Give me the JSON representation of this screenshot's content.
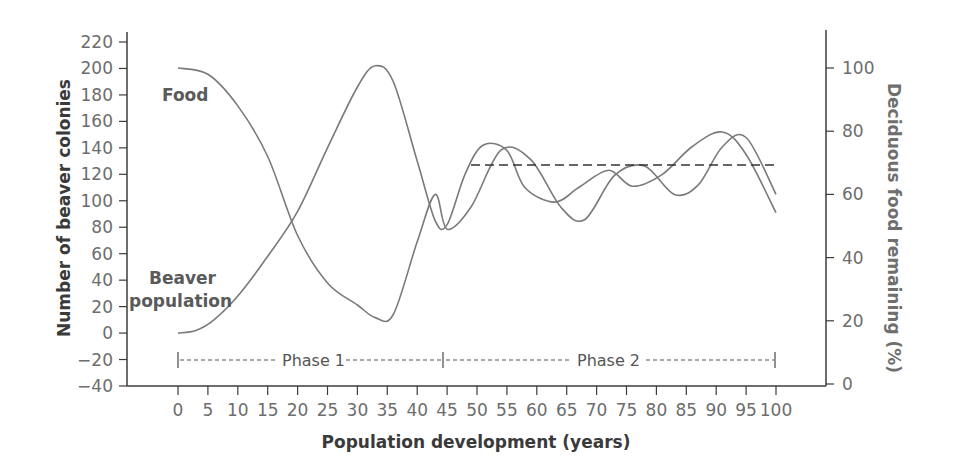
{
  "chart_data": {
    "type": "line",
    "title": "",
    "xlabel": "Population development (years)",
    "ylabel": "Number of beaver colonies",
    "y2label": "Deciduous food remaining (%)",
    "xlim": [
      0,
      100
    ],
    "ylim": [
      -40,
      220
    ],
    "y2lim": [
      0,
      110
    ],
    "grid": false,
    "legend": "inline labels",
    "x_ticks": [
      "0",
      "5",
      "10",
      "15",
      "20",
      "25",
      "30",
      "35",
      "40",
      "45",
      "50",
      "55",
      "60",
      "65",
      "70",
      "75",
      "80",
      "85",
      "90",
      "95",
      "100"
    ],
    "y_ticks": [
      "220",
      "200",
      "180",
      "160",
      "140",
      "120",
      "100",
      "80",
      "60",
      "40",
      "20",
      "0",
      "-20",
      "-40"
    ],
    "y2_ticks": [
      "100",
      "80",
      "60",
      "40",
      "20",
      "0"
    ],
    "series": [
      {
        "name": "Food",
        "axis": "right",
        "x": [
          0,
          5,
          10,
          15,
          20,
          25,
          30,
          33,
          36,
          40,
          43,
          45,
          49,
          54,
          59,
          64,
          68,
          73,
          78,
          83,
          87,
          91,
          95,
          100
        ],
        "values": [
          100,
          98,
          88,
          72,
          47,
          32,
          25,
          21,
          22,
          45,
          60,
          49,
          56,
          74,
          71,
          56,
          52,
          66,
          69,
          60,
          63,
          75,
          78,
          60
        ]
      },
      {
        "name": "Beaver population",
        "axis": "left",
        "x": [
          0,
          3,
          6,
          10,
          15,
          20,
          25,
          30,
          33,
          36,
          40,
          43,
          45,
          48,
          51,
          55,
          58,
          63,
          67,
          72,
          76,
          81,
          86,
          91,
          95,
          100
        ],
        "values": [
          0,
          2,
          10,
          28,
          58,
          92,
          140,
          186,
          202,
          190,
          130,
          85,
          82,
          120,
          142,
          138,
          110,
          99,
          110,
          123,
          111,
          120,
          141,
          152,
          135,
          91
        ]
      },
      {
        "name": "Equilibrium",
        "axis": "left",
        "style": "dashed",
        "x": [
          49,
          100
        ],
        "values": [
          127,
          127
        ]
      }
    ],
    "annotations": [
      {
        "text": "Food",
        "x": 5,
        "y": 185
      },
      {
        "text": "Beaver population",
        "x": 0,
        "y": 30
      },
      {
        "text": "Phase 1",
        "x_range": [
          0,
          44
        ],
        "y": -20
      },
      {
        "text": "Phase 2",
        "x_range": [
          44,
          100
        ],
        "y": -20
      }
    ]
  },
  "labels": {
    "x_axis_title": "Population development (years)",
    "y_axis_title": "Number of beaver colonies",
    "y2_axis_title": "Deciduous food remaining (%)",
    "food": "Food",
    "beaver_line1": "Beaver",
    "beaver_line2": "population",
    "phase1": "Phase 1",
    "phase2": "Phase 2"
  },
  "colors": {
    "axis": "#3c3c3c",
    "curve": "#7a7a7a",
    "dashed": "#333333"
  }
}
